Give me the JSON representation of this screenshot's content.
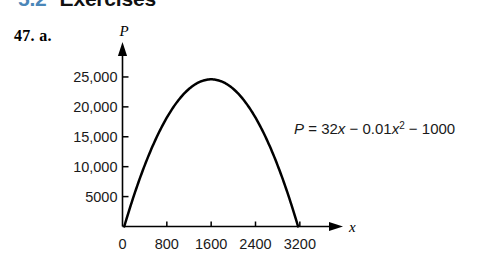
{
  "running_head": {
    "section_number": "5.2",
    "section_title": "Exercises",
    "number_color": "#4a86b8",
    "title_color": "#111111"
  },
  "problem": {
    "label": "47. a."
  },
  "chart_data": {
    "type": "line",
    "title": "",
    "xlabel": "x",
    "ylabel": "P",
    "equation_text": "P = 32x − 0.01x² − 1000",
    "equation_parts": {
      "lhs": "P",
      "equals": "=",
      "term1": "32x",
      "minus1": "−",
      "term2_coef": "0.01",
      "term2_var": "x",
      "term2_exp": "2",
      "minus2": "−",
      "term3": "1000"
    },
    "function": {
      "a": -0.01,
      "b": 32,
      "c": -1000
    },
    "xlim": [
      0,
      3600
    ],
    "ylim": [
      0,
      27500
    ],
    "x_ticks": [
      0,
      800,
      1600,
      2400,
      3200
    ],
    "x_tick_labels": [
      "0",
      "800",
      "1600",
      "2400",
      "3200"
    ],
    "y_ticks": [
      5000,
      10000,
      15000,
      20000,
      25000
    ],
    "y_tick_labels": [
      "5000",
      "10,000",
      "15,000",
      "20,000",
      "25,000"
    ],
    "grid": false,
    "legend": false,
    "axis_arrows": true,
    "curve_color": "#000000",
    "axis_color": "#000000",
    "roots": [
      32,
      3168
    ],
    "vertex": [
      1600,
      24600
    ],
    "points": [
      {
        "x": 32,
        "y": 0
      },
      {
        "x": 200,
        "y": 5000
      },
      {
        "x": 400,
        "y": 10200
      },
      {
        "x": 600,
        "y": 14600
      },
      {
        "x": 800,
        "y": 18200
      },
      {
        "x": 1000,
        "y": 21000
      },
      {
        "x": 1200,
        "y": 23000
      },
      {
        "x": 1400,
        "y": 24200
      },
      {
        "x": 1600,
        "y": 24600
      },
      {
        "x": 1800,
        "y": 24200
      },
      {
        "x": 2000,
        "y": 23000
      },
      {
        "x": 2200,
        "y": 21000
      },
      {
        "x": 2400,
        "y": 18200
      },
      {
        "x": 2600,
        "y": 14600
      },
      {
        "x": 2800,
        "y": 10200
      },
      {
        "x": 3000,
        "y": 5000
      },
      {
        "x": 3168,
        "y": 0
      }
    ]
  }
}
